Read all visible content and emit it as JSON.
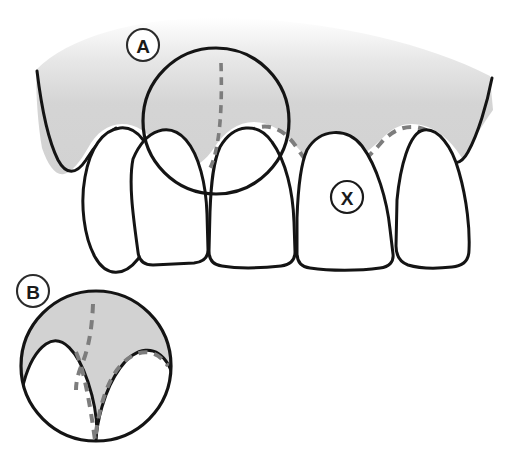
{
  "figure": {
    "background_color": "#ffffff"
  },
  "colors": {
    "gingiva_fill": "#d2d2d2",
    "tooth_fill": "#ffffff",
    "outline": "#141414",
    "dashed_margin": "#7d7d7d",
    "label_text": "#1a1a1a",
    "label_circle_fill": "#ffffff"
  },
  "labels": [
    {
      "id": "A",
      "text": "A",
      "cx": 143,
      "cy": 45,
      "r": 16,
      "role": "magnification-callout-upper"
    },
    {
      "id": "B",
      "text": "B",
      "cx": 33,
      "cy": 291,
      "r": 16,
      "role": "magnified-detail-label"
    },
    {
      "id": "X",
      "text": "X",
      "cx": 347,
      "cy": 197,
      "r": 16,
      "role": "tooth-reference-marker"
    }
  ],
  "regions": {
    "magnifier_upper": {
      "cx": 216,
      "cy": 121,
      "r": 73,
      "label": "A"
    },
    "magnified_detail": {
      "cx": 96,
      "cy": 366,
      "r": 76,
      "label": "B"
    }
  },
  "teeth": [
    {
      "name": "tooth-left-rotated",
      "position": 1
    },
    {
      "name": "tooth-incisor-left",
      "position": 2
    },
    {
      "name": "tooth-incisor-center",
      "position": 3
    },
    {
      "name": "tooth-incisor-marked-x",
      "position": 4
    },
    {
      "name": "tooth-right-lateral",
      "position": 5
    }
  ],
  "annotations": {
    "dashed_gingival_margin": "dashed gray line tracing the gingival margin and interdental papilla",
    "dashed_vertical": "dashed gray line descending through the gingiva to the papilla tip"
  }
}
